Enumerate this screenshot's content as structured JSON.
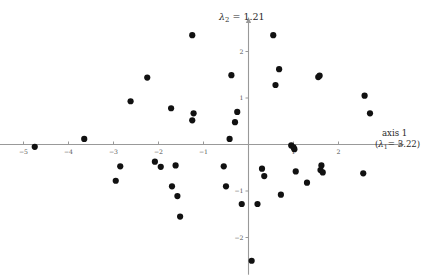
{
  "figure": {
    "background_color": "#ffffff",
    "point_color": "#111111",
    "axis_color": "#999999"
  },
  "labels": {
    "y_axis_title": "λ₂ = 1.21",
    "y_axis_symbol": "λ",
    "y_axis_subscript": "2",
    "y_axis_value": "= 1.21",
    "x_axis_title": "axis 1",
    "x_axis_eigen_prefix": "(",
    "x_axis_symbol": "λ",
    "x_axis_subscript": "1",
    "x_axis_eigen_value": "= 3.22)"
  },
  "chart_data": {
    "type": "scatter",
    "title": "",
    "xlabel": "axis 1 (λ₁ = 3.22)",
    "ylabel": "λ₂ = 1.21",
    "xlim": [
      -5.5,
      3.2
    ],
    "ylim": [
      -2.8,
      2.7
    ],
    "xticks": [
      -5,
      -4,
      -3,
      -2,
      -1,
      1,
      2
    ],
    "yticks": [
      2,
      1,
      -1,
      -2
    ],
    "xtick_labels": [
      "−5",
      "−4",
      "−3",
      "−2",
      "−1",
      "1",
      "2"
    ],
    "ytick_labels": [
      "2",
      "1",
      "−1",
      "−2"
    ],
    "grid": false,
    "legend": null,
    "axes_style": "centered-cross-with-arrows",
    "n_points": 44,
    "points": [
      [
        -4.75,
        -0.05
      ],
      [
        -3.65,
        0.12
      ],
      [
        -2.95,
        -0.78
      ],
      [
        -2.85,
        -0.47
      ],
      [
        -2.62,
        0.93
      ],
      [
        -2.25,
        1.44
      ],
      [
        -2.08,
        -0.37
      ],
      [
        -1.95,
        -0.48
      ],
      [
        -1.72,
        0.78
      ],
      [
        -1.7,
        -0.9
      ],
      [
        -1.62,
        -0.45
      ],
      [
        -1.58,
        -1.11
      ],
      [
        -1.52,
        -1.55
      ],
      [
        -1.25,
        2.35
      ],
      [
        -1.22,
        0.67
      ],
      [
        -1.25,
        0.52
      ],
      [
        -0.55,
        -0.47
      ],
      [
        -0.5,
        -0.9
      ],
      [
        -0.42,
        0.12
      ],
      [
        -0.38,
        1.49
      ],
      [
        -0.3,
        0.48
      ],
      [
        -0.25,
        0.7
      ],
      [
        -0.15,
        -1.28
      ],
      [
        0.07,
        -2.5
      ],
      [
        0.2,
        -1.28
      ],
      [
        0.3,
        -0.52
      ],
      [
        0.35,
        -0.68
      ],
      [
        0.55,
        2.35
      ],
      [
        0.6,
        1.28
      ],
      [
        0.68,
        1.62
      ],
      [
        0.72,
        -1.08
      ],
      [
        0.95,
        -0.02
      ],
      [
        1.0,
        -0.06
      ],
      [
        1.02,
        -0.1
      ],
      [
        1.05,
        -0.58
      ],
      [
        1.3,
        -0.82
      ],
      [
        1.55,
        1.45
      ],
      [
        1.58,
        1.48
      ],
      [
        1.6,
        -0.55
      ],
      [
        1.62,
        -0.45
      ],
      [
        1.65,
        -0.6
      ],
      [
        2.55,
        -0.62
      ],
      [
        2.58,
        1.05
      ],
      [
        2.7,
        0.67
      ]
    ]
  }
}
